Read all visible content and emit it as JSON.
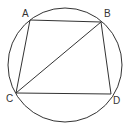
{
  "diagram": {
    "type": "geometry",
    "circle": {
      "cx": 65,
      "cy": 65,
      "r": 57
    },
    "points": [
      {
        "name": "A",
        "x": 30,
        "y": 20,
        "label_x": 22,
        "label_y": 17
      },
      {
        "name": "B",
        "x": 101,
        "y": 22,
        "label_x": 104,
        "label_y": 17
      },
      {
        "name": "C",
        "x": 16,
        "y": 93,
        "label_x": 6,
        "label_y": 102
      },
      {
        "name": "D",
        "x": 111,
        "y": 94,
        "label_x": 113,
        "label_y": 104
      }
    ],
    "segments": [
      {
        "from": "A",
        "to": "B"
      },
      {
        "from": "B",
        "to": "D"
      },
      {
        "from": "D",
        "to": "C"
      },
      {
        "from": "C",
        "to": "A"
      },
      {
        "from": "B",
        "to": "C"
      }
    ],
    "colors": {
      "stroke": "#333333",
      "background": "#ffffff"
    }
  }
}
